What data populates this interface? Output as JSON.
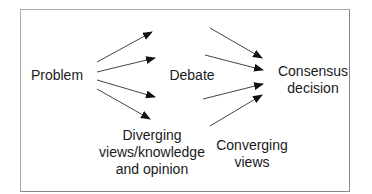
{
  "diagram": {
    "nodes": {
      "problem": {
        "label": "Problem"
      },
      "debate": {
        "label": "Debate"
      },
      "consensus": {
        "lines": [
          "Consensus",
          "decision"
        ]
      },
      "diverging": {
        "lines": [
          "Diverging",
          "views/knowledge",
          "and opinion"
        ]
      },
      "converging": {
        "lines": [
          "Converging",
          "views"
        ]
      }
    },
    "edges": [
      {
        "from": "Problem",
        "to": "Debate",
        "count": 4,
        "direction": "diverging"
      },
      {
        "from": "Debate",
        "to": "Consensus decision",
        "count": 4,
        "direction": "converging"
      }
    ],
    "colors": {
      "line": "#333333",
      "frame": "#999999",
      "text": "#1a1a1a"
    }
  }
}
